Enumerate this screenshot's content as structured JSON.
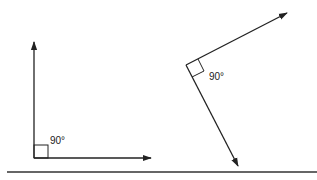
{
  "diagram": {
    "left_angle": {
      "label": "90°"
    },
    "right_angle": {
      "label": "90°"
    }
  }
}
